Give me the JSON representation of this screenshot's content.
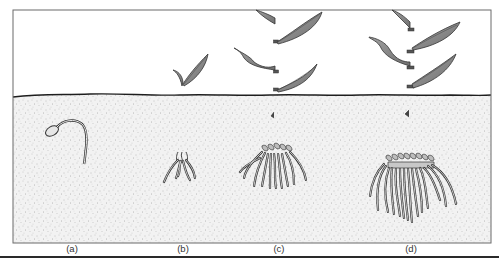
{
  "figure": {
    "panels": [
      {
        "id": "a",
        "label": "(a)",
        "stage": "germinating seed with radicle",
        "x": 72
      },
      {
        "id": "b",
        "label": "(b)",
        "stage": "seedling with first leaves and small root cluster",
        "x": 183
      },
      {
        "id": "c",
        "label": "(c)",
        "stage": "young plant with several leaves and fibrous roots",
        "x": 279
      },
      {
        "id": "d",
        "label": "(d)",
        "stage": "mature plant with large fibrous root system",
        "x": 411
      }
    ],
    "colors": {
      "frame": "#6b6b6b",
      "sky": "#ffffff",
      "soil": "#f0f0f0",
      "soil_line": "#1e1e1e",
      "stem": "#4a4a4a",
      "leaf_fill": "#8a8a8a",
      "root_stroke": "#3a3a3a",
      "rule": "#2a2a2a"
    }
  }
}
